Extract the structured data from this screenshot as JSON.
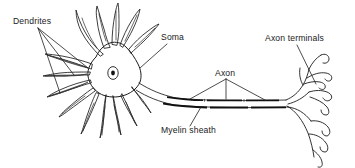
{
  "figure": {
    "background_color": "#ffffff",
    "ink_color": "#1c1c1c",
    "width": 355,
    "height": 168
  },
  "labels": {
    "dendrites": "Dendrites",
    "soma": "Soma",
    "axon": "Axon",
    "myelin_sheath": "Myelin sheath",
    "axon_terminals": "Axon terminals"
  },
  "label_positions": {
    "dendrites": {
      "x": 13,
      "y": 24
    },
    "soma": {
      "x": 161,
      "y": 40
    },
    "axon": {
      "x": 215,
      "y": 76
    },
    "myelin_sheath": {
      "x": 161,
      "y": 133
    },
    "axon_terminals": {
      "x": 265,
      "y": 41
    }
  },
  "parts": [
    {
      "name": "dendrites",
      "description": "Branching tapered projections radiating from the cell body",
      "count": 14
    },
    {
      "name": "soma",
      "description": "Cell body containing the nucleus"
    },
    {
      "name": "nucleus",
      "description": "Small oval inside the soma with a dark center"
    },
    {
      "name": "axon",
      "description": "Long process extending right from the soma"
    },
    {
      "name": "myelin_sheath",
      "description": "Dark segmented insulating bands along the axon",
      "segments": 5
    },
    {
      "name": "axon_terminals",
      "description": "Fine branches ending in rounded bulbs",
      "count": 10
    }
  ]
}
